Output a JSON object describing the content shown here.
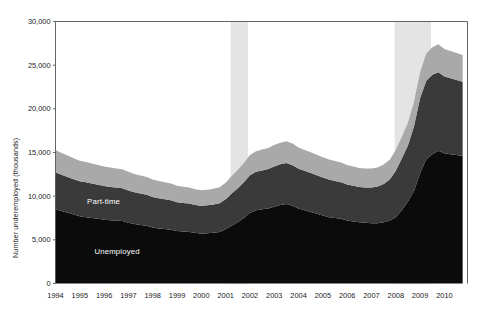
{
  "chart_data": {
    "type": "area",
    "stacked": true,
    "title": "",
    "xlabel": "",
    "ylabel": "Number underemployed (thousands)",
    "ylim": [
      0,
      30000
    ],
    "yticks": [
      "0",
      "5,000",
      "10,000",
      "15,000",
      "20,000",
      "25,000",
      "30,000"
    ],
    "ytick_values": [
      0,
      5000,
      10000,
      15000,
      20000,
      25000,
      30000
    ],
    "xlim": [
      1994,
      2010.95
    ],
    "xticks": [
      "1994",
      "1995",
      "1996",
      "1997",
      "1998",
      "1999",
      "2000",
      "2001",
      "2002",
      "2003",
      "2004",
      "2005",
      "2006",
      "2007",
      "2008",
      "2009",
      "2010"
    ],
    "xtick_values": [
      1994,
      1995,
      1996,
      1997,
      1998,
      1999,
      2000,
      2001,
      2002,
      2003,
      2004,
      2005,
      2006,
      2007,
      2008,
      2009,
      2010
    ],
    "grid": false,
    "legend_position": "inline-annotations",
    "annotations": [
      {
        "text": "Marginally attached",
        "x": 1995.6,
        "y": 15700,
        "color": "#ffffff"
      },
      {
        "text": "Part-time",
        "x": 1995.3,
        "y": 9300,
        "color": "#ffffff"
      },
      {
        "text": "Unemployed",
        "x": 1995.6,
        "y": 3600,
        "color": "#ffffff"
      }
    ],
    "shaded_regions": [
      {
        "name": "recession-2001",
        "x0": 2001.2,
        "x1": 2001.92,
        "color": "#e4e4e4"
      },
      {
        "name": "recession-2008",
        "x0": 2007.95,
        "x1": 2009.45,
        "color": "#e4e4e4"
      }
    ],
    "colors": {
      "unemployed": "#0b0b0b",
      "part_time": "#3a3a3a",
      "marginally_attached": "#a9a9a9",
      "recession_band": "#e4e4e4",
      "axis": "#555555",
      "text": "#1a1a1a"
    },
    "x": [
      1994.0,
      1994.25,
      1994.5,
      1994.75,
      1995.0,
      1995.25,
      1995.5,
      1995.75,
      1996.0,
      1996.25,
      1996.5,
      1996.75,
      1997.0,
      1997.25,
      1997.5,
      1997.75,
      1998.0,
      1998.25,
      1998.5,
      1998.75,
      1999.0,
      1999.25,
      1999.5,
      1999.75,
      2000.0,
      2000.25,
      2000.5,
      2000.75,
      2001.0,
      2001.25,
      2001.5,
      2001.75,
      2002.0,
      2002.25,
      2002.5,
      2002.75,
      2003.0,
      2003.25,
      2003.5,
      2003.75,
      2004.0,
      2004.25,
      2004.5,
      2004.75,
      2005.0,
      2005.25,
      2005.5,
      2005.75,
      2006.0,
      2006.25,
      2006.5,
      2006.75,
      2007.0,
      2007.25,
      2007.5,
      2007.75,
      2008.0,
      2008.25,
      2008.5,
      2008.75,
      2009.0,
      2009.25,
      2009.5,
      2009.75,
      2010.0,
      2010.25,
      2010.5,
      2010.75
    ],
    "series": [
      {
        "name": "Unemployed",
        "color": "#0b0b0b",
        "values": [
          8500,
          8300,
          8100,
          7900,
          7700,
          7600,
          7500,
          7400,
          7300,
          7250,
          7200,
          7150,
          6950,
          6800,
          6700,
          6600,
          6400,
          6300,
          6250,
          6150,
          6000,
          5950,
          5900,
          5800,
          5700,
          5750,
          5800,
          5900,
          6200,
          6600,
          7000,
          7500,
          8100,
          8400,
          8500,
          8600,
          8800,
          9000,
          9100,
          8900,
          8600,
          8400,
          8200,
          8000,
          7800,
          7600,
          7500,
          7400,
          7200,
          7100,
          7000,
          6950,
          6900,
          6900,
          7000,
          7200,
          7600,
          8400,
          9400,
          10600,
          12600,
          14200,
          14800,
          15200,
          14900,
          14800,
          14700,
          14600
        ]
      },
      {
        "name": "Part-time",
        "color": "#3a3a3a",
        "values": [
          4200,
          4150,
          4100,
          4050,
          4000,
          3980,
          3950,
          3900,
          3850,
          3800,
          3780,
          3750,
          3700,
          3650,
          3600,
          3550,
          3500,
          3450,
          3400,
          3380,
          3300,
          3280,
          3250,
          3200,
          3200,
          3200,
          3250,
          3300,
          3450,
          3700,
          3900,
          4100,
          4300,
          4400,
          4450,
          4500,
          4600,
          4650,
          4700,
          4650,
          4550,
          4500,
          4450,
          4400,
          4350,
          4300,
          4250,
          4200,
          4150,
          4100,
          4050,
          4050,
          4100,
          4200,
          4400,
          4700,
          5300,
          5900,
          6400,
          7400,
          8600,
          9000,
          9100,
          9000,
          8800,
          8700,
          8600,
          8500
        ]
      },
      {
        "name": "Marginally attached",
        "color": "#a9a9a9",
        "values": [
          2600,
          2500,
          2450,
          2400,
          2350,
          2330,
          2300,
          2280,
          2250,
          2230,
          2200,
          2180,
          2150,
          2100,
          2080,
          2050,
          2000,
          1980,
          1950,
          1920,
          1880,
          1860,
          1840,
          1800,
          1780,
          1780,
          1800,
          1820,
          1900,
          2000,
          2100,
          2200,
          2300,
          2350,
          2400,
          2420,
          2450,
          2480,
          2500,
          2470,
          2420,
          2400,
          2380,
          2350,
          2320,
          2300,
          2280,
          2250,
          2220,
          2200,
          2180,
          2170,
          2160,
          2180,
          2220,
          2280,
          2400,
          2500,
          2600,
          2800,
          3000,
          3100,
          3150,
          3200,
          3150,
          3120,
          3100,
          3050
        ]
      }
    ]
  }
}
